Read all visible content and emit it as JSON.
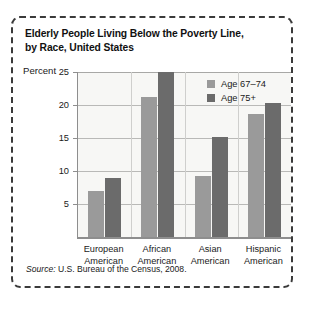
{
  "figure": {
    "title": "Elderly People Living Below the Poverty Line, by Race, United States",
    "title_line1": "Elderly People Living Below the Poverty Line,",
    "title_line2": "by Race, United States",
    "axis_label": "Percent",
    "source_prefix": "Source:",
    "source_text": " U.S. Bureau of the Census, 2008."
  },
  "colors": {
    "series_light": "#9a9a9a",
    "series_dark": "#6b6b6b",
    "plot_background": "#f7f7f5",
    "gridline": "#b9b9b7",
    "axis": "#8e8e8e",
    "border": "#3a3a3a",
    "text": "#1a1a1a"
  },
  "chart_data": {
    "type": "bar",
    "title": "Elderly People Living Below the Poverty Line, by Race, United States",
    "subtitle": "",
    "xlabel": "",
    "ylabel": "Percent",
    "ylim": [
      0,
      25
    ],
    "yticks": [
      5,
      10,
      15,
      20,
      25
    ],
    "ytick_labels": [
      "5",
      "10",
      "15",
      "20",
      "25"
    ],
    "grid": true,
    "legend_position": "inside-top-right",
    "categories": [
      "European American",
      "African American",
      "Asian American",
      "Hispanic American"
    ],
    "category_lines": [
      [
        "European",
        "American"
      ],
      [
        "African",
        "American"
      ],
      [
        "Asian",
        "American"
      ],
      [
        "Hispanic",
        "American"
      ]
    ],
    "series": [
      {
        "name": "Age 67–74",
        "color": "#9a9a9a",
        "values": [
          7.0,
          21.2,
          9.2,
          18.7
        ]
      },
      {
        "name": "Age 75+",
        "color": "#6b6b6b",
        "values": [
          9.0,
          25.0,
          15.2,
          20.3
        ]
      }
    ],
    "annotations": [],
    "source": "Source: U.S. Bureau of the Census, 2008."
  }
}
